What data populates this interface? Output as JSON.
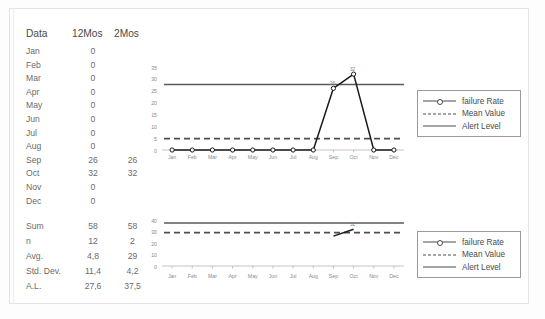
{
  "table": {
    "headers": [
      "Data",
      "12Mos",
      "2Mos"
    ],
    "rows": [
      {
        "label": "Jan",
        "v12": "0",
        "v2": ""
      },
      {
        "label": "Feb",
        "v12": "0",
        "v2": ""
      },
      {
        "label": "Mar",
        "v12": "0",
        "v2": ""
      },
      {
        "label": "Apr",
        "v12": "0",
        "v2": ""
      },
      {
        "label": "May",
        "v12": "0",
        "v2": ""
      },
      {
        "label": "Jun",
        "v12": "0",
        "v2": ""
      },
      {
        "label": "Jul",
        "v12": "0",
        "v2": ""
      },
      {
        "label": "Aug",
        "v12": "0",
        "v2": ""
      },
      {
        "label": "Sep",
        "v12": "26",
        "v2": "26"
      },
      {
        "label": "Oct",
        "v12": "32",
        "v2": "32"
      },
      {
        "label": "Nov",
        "v12": "0",
        "v2": ""
      },
      {
        "label": "Dec",
        "v12": "0",
        "v2": ""
      }
    ]
  },
  "summary": {
    "rows": [
      {
        "label": "Sum",
        "v12": "58",
        "v2": "58"
      },
      {
        "label": "n",
        "v12": "12",
        "v2": "2"
      },
      {
        "label": "Avg.",
        "v12": "4,8",
        "v2": "29"
      },
      {
        "label": "Std. Dev.",
        "v12": "11,4",
        "v2": "4,2"
      },
      {
        "label": "A.L.",
        "v12": "27,6",
        "v2": "37,5"
      }
    ]
  },
  "legend": {
    "items": [
      {
        "label": "failure Rate",
        "style": "line-marker"
      },
      {
        "label": "Mean Value",
        "style": "dashed"
      },
      {
        "label": "Alert Level",
        "style": "line"
      }
    ]
  },
  "colors": {
    "series": "#1a1a1a",
    "mean": "#4d4d4d",
    "alert": "#5a5a5a",
    "axis": "#b5b5b5",
    "tick_text": "#8a8a8a",
    "frame": "#e3e3e3"
  },
  "chart_data": [
    {
      "type": "line",
      "id": "chart-top",
      "title": "",
      "xlabel": "",
      "ylabel": "",
      "categories": [
        "Jan",
        "Feb",
        "Mar",
        "Apr",
        "May",
        "Jun",
        "Jul",
        "Aug",
        "Sep",
        "Oct",
        "Nov",
        "Dec"
      ],
      "ylim": [
        0,
        35
      ],
      "yticks": [
        0,
        5,
        10,
        15,
        20,
        25,
        30,
        35
      ],
      "grid": false,
      "legend_position": "right",
      "series": [
        {
          "name": "failure Rate",
          "values": [
            0,
            0,
            0,
            0,
            0,
            0,
            0,
            0,
            26,
            32,
            0,
            0
          ],
          "style": "line-marker",
          "point_labels": {
            "Sep": "26",
            "Oct": "32"
          }
        },
        {
          "name": "Mean Value",
          "value": 4.8,
          "style": "dashed-horizontal"
        },
        {
          "name": "Alert Level",
          "value": 27.6,
          "style": "solid-horizontal"
        }
      ]
    },
    {
      "type": "line",
      "id": "chart-bottom",
      "title": "",
      "xlabel": "",
      "ylabel": "",
      "categories": [
        "Jan",
        "Feb",
        "Mar",
        "Apr",
        "May",
        "Jun",
        "Jul",
        "Aug",
        "Sep",
        "Oct",
        "Nov",
        "Dec"
      ],
      "ylim": [
        0,
        40
      ],
      "yticks": [
        0,
        10,
        20,
        30,
        40
      ],
      "grid": false,
      "legend_position": "right",
      "series": [
        {
          "name": "failure Rate",
          "values": [
            null,
            null,
            null,
            null,
            null,
            null,
            null,
            null,
            26,
            32,
            null,
            null
          ],
          "style": "line-marker",
          "point_labels": {
            "Oct": "32"
          }
        },
        {
          "name": "Mean Value",
          "value": 29,
          "style": "dashed-horizontal"
        },
        {
          "name": "Alert Level",
          "value": 37.5,
          "style": "solid-horizontal"
        }
      ]
    }
  ]
}
